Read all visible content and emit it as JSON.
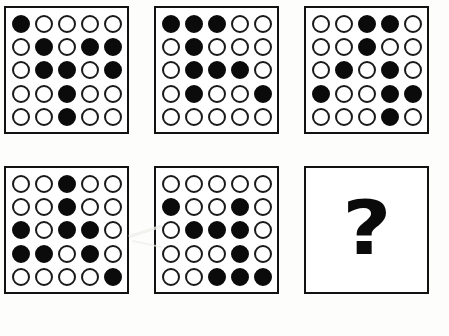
{
  "puzzle": {
    "type": "matrix-reasoning-sequence",
    "rows": 2,
    "columns": 3,
    "grid_size": "5x5",
    "filled_symbol": "filled-circle",
    "empty_symbol": "empty-circle",
    "colors": {
      "ink": "#0b0b0b",
      "panel_background": "#ffffff",
      "page_background": "#fdfdfb"
    },
    "panels": [
      {
        "name": "panel-1",
        "position": 1,
        "kind": "matrix",
        "filled_count": 10,
        "matrix": [
          [
            1,
            0,
            0,
            0,
            0
          ],
          [
            0,
            1,
            0,
            1,
            1
          ],
          [
            0,
            1,
            1,
            0,
            1
          ],
          [
            0,
            0,
            1,
            0,
            0
          ],
          [
            0,
            0,
            1,
            0,
            0
          ]
        ]
      },
      {
        "name": "panel-2",
        "position": 2,
        "kind": "matrix",
        "filled_count": 9,
        "matrix": [
          [
            1,
            1,
            1,
            0,
            0
          ],
          [
            0,
            1,
            0,
            0,
            0
          ],
          [
            0,
            1,
            1,
            1,
            0
          ],
          [
            0,
            1,
            0,
            0,
            1
          ],
          [
            0,
            0,
            0,
            0,
            0
          ]
        ]
      },
      {
        "name": "panel-3",
        "position": 3,
        "kind": "matrix",
        "filled_count": 9,
        "matrix": [
          [
            0,
            0,
            1,
            1,
            0
          ],
          [
            0,
            0,
            1,
            0,
            0
          ],
          [
            0,
            1,
            0,
            1,
            0
          ],
          [
            1,
            0,
            0,
            1,
            1
          ],
          [
            0,
            0,
            0,
            1,
            0
          ]
        ]
      },
      {
        "name": "panel-4",
        "position": 4,
        "kind": "matrix",
        "filled_count": 9,
        "matrix": [
          [
            0,
            0,
            1,
            0,
            0
          ],
          [
            0,
            0,
            1,
            0,
            0
          ],
          [
            1,
            0,
            1,
            1,
            0
          ],
          [
            1,
            1,
            0,
            1,
            0
          ],
          [
            0,
            0,
            0,
            0,
            1
          ]
        ]
      },
      {
        "name": "panel-5",
        "position": 5,
        "kind": "matrix",
        "filled_count": 9,
        "matrix": [
          [
            0,
            0,
            0,
            0,
            0
          ],
          [
            1,
            0,
            0,
            1,
            0
          ],
          [
            0,
            1,
            1,
            1,
            0
          ],
          [
            0,
            0,
            0,
            1,
            0
          ],
          [
            0,
            0,
            1,
            1,
            1
          ]
        ]
      },
      {
        "name": "panel-6-answer",
        "position": 6,
        "kind": "question",
        "question_glyph": "?"
      }
    ]
  }
}
